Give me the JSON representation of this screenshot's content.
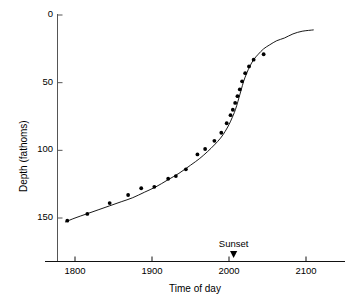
{
  "chart_data": {
    "type": "scatter",
    "title": "",
    "xlabel": "Time of day",
    "ylabel": "Depth (fathoms)",
    "xlim": [
      1783,
      2113
    ],
    "ylim": [
      0,
      170
    ],
    "y_inverted": true,
    "grid": false,
    "legend": null,
    "xticks": [
      1800,
      1900,
      2000,
      2100
    ],
    "xtick_labels": [
      "1800",
      "1900",
      "2000",
      "2100"
    ],
    "yticks": [
      0,
      50,
      100,
      150
    ],
    "ytick_labels": [
      "0",
      "50",
      "100",
      "150"
    ],
    "series": [
      {
        "name": "Observed depth",
        "type": "scatter",
        "marker": "filled-circle",
        "color": "#000000",
        "x": [
          1790,
          1816,
          1845,
          1869,
          1886,
          1903,
          1921,
          1931,
          1944,
          1959,
          1969,
          1981,
          1990,
          1997,
          2002,
          2005,
          2008,
          2011,
          2014,
          2017,
          2021,
          2026,
          2032,
          2045
        ],
        "y": [
          152,
          147,
          139,
          133,
          128,
          127,
          121,
          119,
          114,
          103,
          99,
          93,
          87,
          80,
          74,
          70,
          65,
          60,
          55,
          49,
          43,
          38,
          33,
          29
        ]
      },
      {
        "name": "Fitted curve",
        "type": "line",
        "color": "#000000",
        "x": [
          1787,
          1800,
          1815,
          1830,
          1845,
          1860,
          1875,
          1890,
          1905,
          1920,
          1935,
          1950,
          1962,
          1972,
          1981,
          1989,
          1995,
          2000,
          2004,
          2007,
          2010,
          2013,
          2016,
          2019,
          2023,
          2027,
          2032,
          2038,
          2045,
          2053,
          2062,
          2072,
          2083,
          2095,
          2110
        ],
        "y": [
          153,
          150,
          147,
          144,
          141,
          138,
          135,
          131,
          127,
          122,
          117,
          111,
          106,
          101,
          96,
          91,
          86,
          81,
          76,
          72,
          67,
          61,
          55,
          49,
          43,
          38,
          33,
          29,
          25,
          22,
          19,
          17,
          14,
          12,
          11
        ]
      }
    ],
    "annotations": [
      {
        "name": "sunset",
        "label": "Sunset",
        "x": 2006,
        "marker": "down-triangle",
        "color": "#000000"
      }
    ]
  }
}
